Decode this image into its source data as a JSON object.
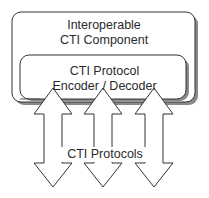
{
  "diagram": {
    "outer_box": {
      "line1": "Interoperable",
      "line2": "CTI Component"
    },
    "inner_box": {
      "line1": "CTI Protocol",
      "line2": "Encoder / Decoder"
    },
    "arrows": {
      "count": 3,
      "type": "bidirectional",
      "label": "CTI Protocols"
    },
    "colors": {
      "stroke": "#333333",
      "shadow": "#8a8a8a",
      "fill": "#ffffff"
    }
  }
}
